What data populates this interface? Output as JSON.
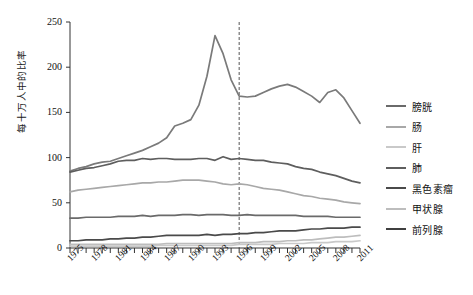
{
  "chart_data": {
    "type": "line",
    "title": "",
    "xlabel": "",
    "ylabel": "每十万人中的比率",
    "xlim": [
      1975,
      2011
    ],
    "ylim": [
      0,
      250
    ],
    "yticks": [
      0,
      50,
      100,
      150,
      200,
      250
    ],
    "xticks": [
      1975,
      1978,
      1981,
      1984,
      1987,
      1990,
      1993,
      1996,
      1999,
      2002,
      2005,
      2008,
      2011
    ],
    "grid": false,
    "legend_position": "right",
    "annotations": [
      {
        "type": "vline",
        "x": 1996,
        "style": "dashed",
        "color": "#555555"
      }
    ],
    "x": [
      1975,
      1976,
      1977,
      1978,
      1979,
      1980,
      1981,
      1982,
      1983,
      1984,
      1985,
      1986,
      1987,
      1988,
      1989,
      1990,
      1991,
      1992,
      1993,
      1994,
      1995,
      1996,
      1997,
      1998,
      1999,
      2000,
      2001,
      2002,
      2003,
      2004,
      2005,
      2006,
      2007,
      2008,
      2009,
      2010,
      2011
    ],
    "series": [
      {
        "name": "前列腺",
        "color": "#7a7a7a",
        "values": [
          85,
          88,
          90,
          93,
          95,
          96,
          99,
          102,
          105,
          108,
          112,
          116,
          122,
          135,
          138,
          142,
          158,
          190,
          235,
          215,
          186,
          168,
          167,
          168,
          172,
          176,
          179,
          181,
          178,
          173,
          168,
          161,
          172,
          175,
          166,
          152,
          138
        ]
      },
      {
        "name": "肺",
        "color": "#5e5e5e",
        "values": [
          84,
          86,
          88,
          89,
          91,
          93,
          96,
          97,
          97,
          99,
          98,
          99,
          99,
          98,
          98,
          98,
          99,
          99,
          97,
          101,
          98,
          99,
          98,
          97,
          97,
          95,
          94,
          93,
          90,
          88,
          87,
          84,
          82,
          80,
          77,
          74,
          72
        ]
      },
      {
        "name": "肠",
        "color": "#a8a8a8",
        "values": [
          62,
          64,
          65,
          66,
          67,
          68,
          69,
          70,
          71,
          72,
          72,
          73,
          73,
          74,
          75,
          75,
          75,
          74,
          73,
          71,
          70,
          71,
          70,
          68,
          66,
          65,
          64,
          62,
          60,
          58,
          57,
          55,
          54,
          53,
          51,
          50,
          49
        ]
      },
      {
        "name": "膀胱",
        "color": "#6a6a6a",
        "values": [
          33,
          33,
          34,
          34,
          34,
          34,
          35,
          35,
          35,
          36,
          35,
          36,
          36,
          36,
          37,
          37,
          36,
          37,
          37,
          37,
          36,
          36,
          37,
          36,
          36,
          36,
          36,
          36,
          36,
          35,
          35,
          35,
          35,
          34,
          34,
          34,
          34
        ]
      },
      {
        "name": "黑色素瘤",
        "color": "#4a4a4a",
        "values": [
          8,
          8,
          9,
          9,
          9,
          10,
          10,
          11,
          11,
          12,
          12,
          13,
          14,
          14,
          14,
          14,
          14,
          15,
          14,
          15,
          15,
          16,
          16,
          17,
          17,
          18,
          19,
          19,
          19,
          20,
          21,
          21,
          22,
          22,
          22,
          23,
          23
        ]
      },
      {
        "name": "甲状腺",
        "color": "#bdbdbd",
        "values": [
          4,
          4,
          4,
          4,
          4,
          4,
          4,
          4,
          4,
          4,
          4,
          4,
          5,
          5,
          5,
          5,
          5,
          5,
          5,
          5,
          5,
          6,
          6,
          6,
          7,
          7,
          7,
          8,
          8,
          9,
          9,
          10,
          11,
          12,
          12,
          13,
          14
        ]
      },
      {
        "name": "肝",
        "color": "#c9c9c9",
        "values": [
          2,
          2,
          2,
          2,
          2,
          2,
          2,
          2,
          2,
          2,
          2,
          3,
          3,
          3,
          3,
          3,
          3,
          3,
          3,
          3,
          3,
          4,
          4,
          4,
          4,
          4,
          5,
          5,
          5,
          5,
          6,
          6,
          6,
          7,
          7,
          7,
          8
        ]
      }
    ]
  },
  "axis": {
    "y_tick_labels": [
      "250",
      "200",
      "150",
      "100",
      "50",
      "0"
    ],
    "x_tick_labels": [
      "1975",
      "1978",
      "1981",
      "1984",
      "1987",
      "1990",
      "1993",
      "1996",
      "1999",
      "2002",
      "2005",
      "2008",
      "2011"
    ],
    "y_axis_title": "每十万人中的比率"
  },
  "legend": {
    "items": [
      {
        "label": "膀胱",
        "color": "#6a6a6a"
      },
      {
        "label": "肠",
        "color": "#a8a8a8"
      },
      {
        "label": "肝",
        "color": "#c9c9c9"
      },
      {
        "label": "肺",
        "color": "#5e5e5e"
      },
      {
        "label": "黑色素瘤",
        "color": "#4a4a4a"
      },
      {
        "label": "甲状腺",
        "color": "#bdbdbd"
      },
      {
        "label": "前列腺",
        "color": "#3f3f3f"
      }
    ]
  }
}
